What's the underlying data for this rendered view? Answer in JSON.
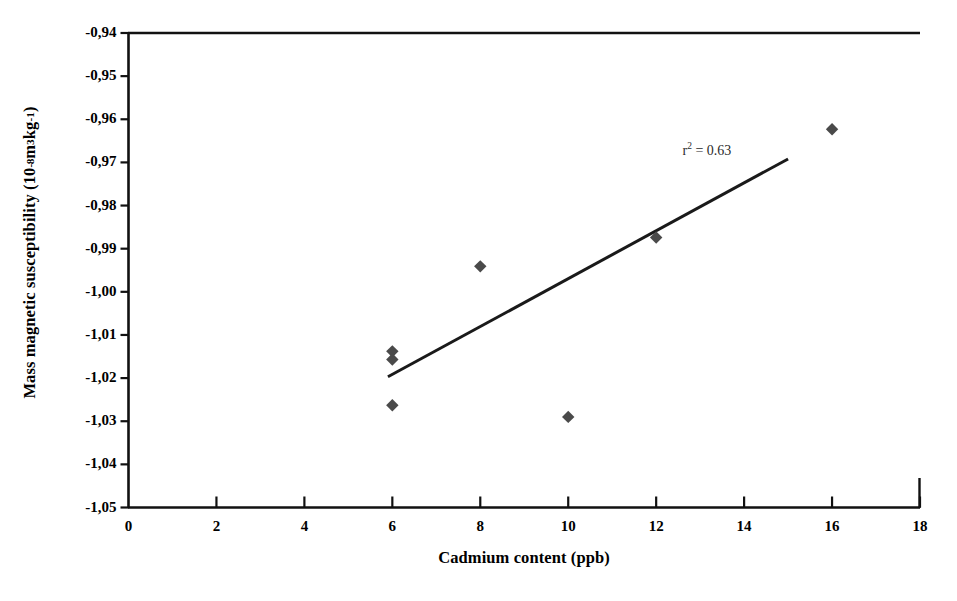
{
  "chart_data": {
    "type": "scatter",
    "title": "",
    "xlabel": "Cadmium content (ppb)",
    "ylabel_plain": "Mass magnetic susceptibility (10 -8 m3kg-1)",
    "ylabel_parts": {
      "main": "Mass magnetic susceptibility (10",
      "exp1": "-8",
      "mid": " m",
      "exp2": "3",
      "unit": "kg",
      "exp3": "-1",
      "close": ")"
    },
    "xlim": [
      0,
      18
    ],
    "ylim": [
      -1.05,
      -0.94
    ],
    "xticks": [
      0,
      2,
      4,
      6,
      8,
      10,
      12,
      14,
      16,
      18
    ],
    "xtick_labels": [
      "0",
      "2",
      "4",
      "6",
      "8",
      "10",
      "12",
      "14",
      "16",
      "18"
    ],
    "yticks": [
      -0.94,
      -0.95,
      -0.96,
      -0.97,
      -0.98,
      -0.99,
      -1.0,
      -1.01,
      -1.02,
      -1.03,
      -1.04,
      -1.05
    ],
    "ytick_labels": [
      "-0,94",
      "-0,95",
      "-0,96",
      "-0,97",
      "-0,98",
      "-0,99",
      "-1,00",
      "-1,01",
      "-1,02",
      "-1,03",
      "-1,04",
      "-1,05"
    ],
    "grid": false,
    "legend": false,
    "marker": "diamond",
    "marker_color": "#4a4a4a",
    "points": [
      {
        "x": 6,
        "y": -1.0138
      },
      {
        "x": 6,
        "y": -1.0157
      },
      {
        "x": 6,
        "y": -1.0263
      },
      {
        "x": 8,
        "y": -0.9941
      },
      {
        "x": 10,
        "y": -1.029
      },
      {
        "x": 12,
        "y": -0.9874
      },
      {
        "x": 16,
        "y": -0.9623
      }
    ],
    "trendline": {
      "type": "linear",
      "x_start": 5.9,
      "y_start": -1.0197,
      "x_end": 15.0,
      "y_end": -0.9692,
      "color": "#1a1a1a"
    },
    "annotations": [
      {
        "name": "r-squared",
        "text": "r² = 0.63",
        "x": 13.6,
        "y": -0.9673
      }
    ]
  },
  "annotation": {
    "r2_prefix": "r",
    "r2_exp": "2",
    "r2_value": " = 0.63"
  }
}
